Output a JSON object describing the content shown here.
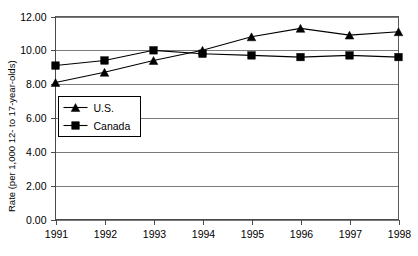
{
  "chart_data": {
    "type": "line",
    "title": "",
    "xlabel": "",
    "ylabel": "Rate (per 1,000 12- to 17-year-olds)",
    "categories": [
      "1991",
      "1992",
      "1993",
      "1994",
      "1995",
      "1996",
      "1997",
      "1998"
    ],
    "x": [
      1991,
      1992,
      1993,
      1994,
      1995,
      1996,
      1997,
      1998
    ],
    "series": [
      {
        "name": "U.S.",
        "marker": "triangle",
        "color": "#000000",
        "values": [
          8.1,
          8.7,
          9.4,
          10.0,
          10.8,
          11.3,
          10.9,
          11.1
        ]
      },
      {
        "name": "Canada",
        "marker": "square",
        "color": "#000000",
        "values": [
          9.1,
          9.4,
          10.0,
          9.8,
          9.7,
          9.6,
          9.7,
          9.6
        ]
      }
    ],
    "ylim": [
      0.0,
      12.0
    ],
    "ytick_values": [
      0.0,
      2.0,
      4.0,
      6.0,
      8.0,
      10.0,
      12.0
    ],
    "ytick_labels": [
      "0.00",
      "2.00",
      "4.00",
      "6.00",
      "8.00",
      "10.00",
      "12.00"
    ],
    "grid": true,
    "grid_axis": "y",
    "legend_position": "inside-lower-left",
    "legend_entries": [
      "U.S.",
      "Canada"
    ]
  },
  "axes": {
    "y_title": "Rate (per 1,000 12- to 17-year-olds)"
  }
}
